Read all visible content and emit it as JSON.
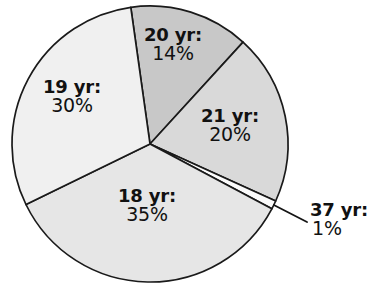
{
  "chart_data": {
    "type": "pie",
    "title": "",
    "subtitle": "",
    "xlabel": "",
    "ylabel": "",
    "legend_position": "none",
    "grid": false,
    "categories": [
      "20 yr",
      "21 yr",
      "37 yr",
      "18 yr",
      "19 yr"
    ],
    "values": [
      14,
      20,
      1,
      35,
      30
    ],
    "value_unit": "%",
    "slices": [
      {
        "name": "20 yr",
        "label": "20 yr:",
        "value": 14,
        "value_label": "14%",
        "color": "#c8c8c8",
        "start_angle_deg": 352,
        "end_angle_deg": 42.4,
        "callout": false
      },
      {
        "name": "21 yr",
        "label": "21 yr:",
        "value": 20,
        "value_label": "20%",
        "color": "#d9d9d9",
        "start_angle_deg": 42.4,
        "end_angle_deg": 114.4,
        "callout": false
      },
      {
        "name": "37 yr",
        "label": "37 yr:",
        "value": 1,
        "value_label": "1%",
        "color": "#fbfbfb",
        "start_angle_deg": 114.4,
        "end_angle_deg": 118.0,
        "callout": true
      },
      {
        "name": "18 yr",
        "label": "18 yr:",
        "value": 35,
        "value_label": "35%",
        "color": "#e6e6e6",
        "start_angle_deg": 118.0,
        "end_angle_deg": 244.0,
        "callout": false
      },
      {
        "name": "19 yr",
        "label": "19 yr:",
        "value": 30,
        "value_label": "30%",
        "color": "#f0f0f0",
        "start_angle_deg": 244.0,
        "end_angle_deg": 352.0,
        "callout": false
      }
    ],
    "colors": {
      "outline": "#1a1a1a",
      "text": "#111111",
      "background": "#ffffff",
      "leader_line": "#141414"
    }
  }
}
